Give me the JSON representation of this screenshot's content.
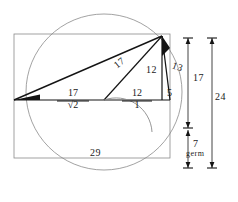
{
  "figure": {
    "stroke_dark": "#141414",
    "stroke_light": "#8a8a8a",
    "background": "#ffffff"
  },
  "labels": {
    "hypotenuse_long": "17",
    "vertical_leg": "12",
    "short_hypotenuse": "13",
    "short_leg": "5",
    "base_left_numerator": "17",
    "base_left_denominator": "√2",
    "base_mid_numerator": "12",
    "base_mid_denominator": "1",
    "bottom_width": "29",
    "right_dim_inner": "17",
    "right_dim_outer": "24",
    "right_dim_lower": "7",
    "right_dim_lower_note": "germ"
  },
  "geometry": {
    "rect": {
      "x": 14,
      "y": 34,
      "w": 156,
      "h": 124
    },
    "circle": {
      "cx": 104,
      "cy": 92,
      "r": 78
    },
    "baseline_y": 100,
    "apex": {
      "x": 162,
      "y": 36
    },
    "center_vertex": {
      "x": 104,
      "y": 100
    },
    "left_vertex": {
      "x": 14,
      "y": 100
    },
    "right_vertex": {
      "x": 170,
      "y": 100
    },
    "dim_line_inner_x": 188,
    "dim_line_outer_x": 212,
    "dim_top_y": 36,
    "dim_mid_y": 130,
    "dim_bottom_y": 158
  }
}
